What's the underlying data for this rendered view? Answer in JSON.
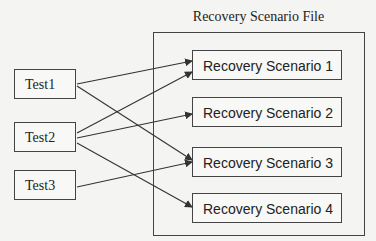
{
  "diagram": {
    "title": "Recovery Scenario File",
    "tests": [
      {
        "label": "Test1"
      },
      {
        "label": "Test2"
      },
      {
        "label": "Test3"
      }
    ],
    "scenarios": [
      {
        "label": "Recovery Scenario 1"
      },
      {
        "label": "Recovery Scenario 2"
      },
      {
        "label": "Recovery Scenario 3"
      },
      {
        "label": "Recovery Scenario 4"
      }
    ],
    "connections": [
      {
        "from": "Test1",
        "to": "Recovery Scenario 1"
      },
      {
        "from": "Test1",
        "to": "Recovery Scenario 3"
      },
      {
        "from": "Test2",
        "to": "Recovery Scenario 1"
      },
      {
        "from": "Test2",
        "to": "Recovery Scenario 2"
      },
      {
        "from": "Test2",
        "to": "Recovery Scenario 4"
      },
      {
        "from": "Test3",
        "to": "Recovery Scenario 3"
      }
    ]
  }
}
